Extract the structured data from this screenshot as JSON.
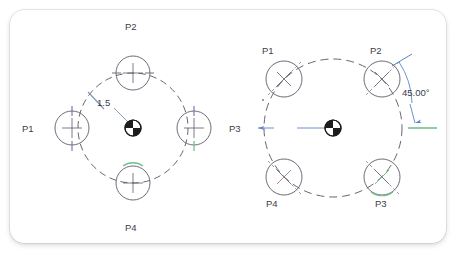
{
  "document": {
    "title": "Circular pattern dimension illustration",
    "background_color": "#ffffff",
    "card_color": "#ffffff"
  },
  "colors": {
    "line_dark": "#55555f",
    "circle_outline": "#5b5b6b",
    "purple_tick": "#7a6aa8",
    "green_tick": "#72c28a",
    "blue_dim": "#5b84c4",
    "blue_grey": "#7f95b8",
    "text": "#3b3b4a",
    "center_marker": "#1c1c1c"
  },
  "figures": [
    {
      "id": "left-figure",
      "name": "radius-pattern-figure",
      "center_marker": "pie-quadrant-symbol",
      "bolt_circle": {
        "style": "dashed",
        "cx": 133,
        "cy": 128,
        "r": 55
      },
      "dimension": {
        "name": "radius-dimension",
        "value": "1.5",
        "type": "radius",
        "leader": "from tick on dashed circle to center marker"
      },
      "holes": [
        {
          "label": "P1",
          "angle_deg": 180,
          "label_x": 22,
          "label_y": 131,
          "cx": 72,
          "cy": 128,
          "r": 17,
          "cross": "vertical",
          "ticks": [
            "purple-top",
            "purple-bottom"
          ]
        },
        {
          "label": "P2",
          "angle_deg": 90,
          "label_x": 125,
          "label_y": 27,
          "cx": 133,
          "cy": 73,
          "r": 17,
          "cross": "horizontal",
          "ticks": [
            "grey-left",
            "grey-right"
          ]
        },
        {
          "label": "P3",
          "angle_deg": 0,
          "label_x": 229,
          "label_y": 131,
          "cx": 194,
          "cy": 128,
          "r": 17,
          "cross": "vertical",
          "ticks": [
            "purple-top",
            "green-bottom"
          ]
        },
        {
          "label": "P4",
          "angle_deg": 270,
          "label_x": 125,
          "label_y": 228,
          "cx": 133,
          "cy": 183,
          "r": 17,
          "cross": "horizontal",
          "ticks": [
            "green-top"
          ]
        }
      ]
    },
    {
      "id": "right-figure",
      "name": "angle-pattern-figure",
      "center_marker": "pie-quadrant-symbol",
      "bolt_circle": {
        "style": "dashed",
        "cx": 333,
        "cy": 128,
        "r": 69
      },
      "dimension": {
        "name": "angle-dimension",
        "value": "45.00",
        "unit": "°",
        "display": "45.00°",
        "type": "angular",
        "label_x": 403,
        "label_y": 93
      },
      "holes": [
        {
          "label": "P1",
          "angle_deg": 135,
          "label_x": 264,
          "label_y": 51,
          "cx": 284,
          "cy": 79,
          "r": 18,
          "cross": "diagonal",
          "ticks": [
            "grey-diagonal"
          ]
        },
        {
          "label": "P2",
          "angle_deg": 45,
          "label_x": 372,
          "label_y": 51,
          "cx": 382,
          "cy": 79,
          "r": 18,
          "cross": "diagonal",
          "ticks": [
            "blue-diagonal"
          ]
        },
        {
          "label": "P3",
          "angle_deg": 315,
          "label_x": 375,
          "label_y": 204,
          "cx": 382,
          "cy": 177,
          "r": 18,
          "cross": "diagonal",
          "ticks": [
            "green-diagonal"
          ]
        },
        {
          "label": "P4",
          "angle_deg": 225,
          "label_x": 268,
          "label_y": 204,
          "cx": 284,
          "cy": 177,
          "r": 18,
          "cross": "diagonal",
          "ticks": [
            "pink-diagonal"
          ]
        }
      ]
    }
  ]
}
